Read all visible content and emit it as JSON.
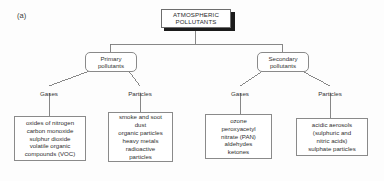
{
  "figure": {
    "label": "(a)"
  },
  "root": {
    "line1": "ATMOSPHERIC",
    "line2": "POLLUTANTS"
  },
  "branches": [
    {
      "id": "primary",
      "line1": "Primary",
      "line2": "pollutants"
    },
    {
      "id": "secondary",
      "line1": "Secondary",
      "line2": "pollutants"
    }
  ],
  "categories": {
    "primary_gases": "Gases",
    "primary_particles": "Particles",
    "secondary_gases": "Gases",
    "secondary_particles": "Particles"
  },
  "leaves": {
    "primary_gases": [
      "oxides of nitrogen",
      "carbon monoxide",
      "sulphur dioxide",
      "volatile organic",
      "compounds (VOC)"
    ],
    "primary_particles": [
      "smoke and soot",
      "dust",
      "organic particles",
      "heavy metals",
      "radioactive",
      "particles"
    ],
    "secondary_gases": [
      "ozone",
      "peroxyacetyl",
      "nitrate (PAN)",
      "aldehydes",
      "ketones"
    ],
    "secondary_particles": [
      "acidic aerosols",
      "(sulphuric and",
      "nitric acids)",
      "sulphate particles"
    ]
  },
  "colors": {
    "background": "#fdfdfd",
    "line": "#7a7a7a",
    "border": "#8a8a8a",
    "root_shadow": "#1b1b1b",
    "text": "#2f2f2f"
  }
}
